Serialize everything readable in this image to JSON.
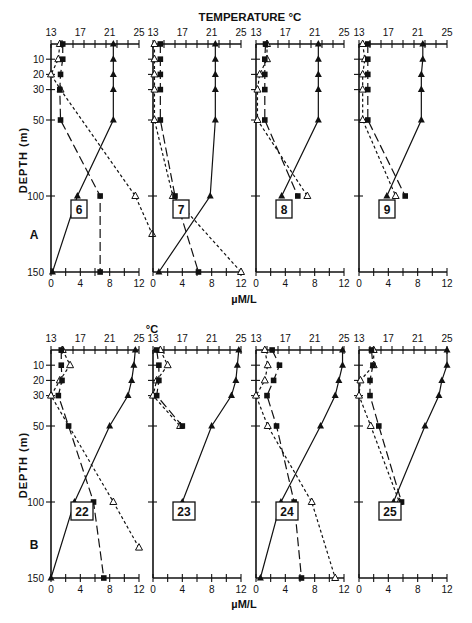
{
  "chart_data": {
    "type": "line",
    "title": "TEMPERATURE °C",
    "top_axis_label_row_A": "TEMPERATURE °C",
    "top_axis_label_row_B": "°C",
    "xlabel": "µM/L",
    "ylabel": "DEPTH (m)",
    "temperature_ticks": [
      "13",
      "17",
      "21",
      "25"
    ],
    "temperature_range": [
      13,
      25
    ],
    "concentration_ticks": [
      "0",
      "4",
      "8",
      "12"
    ],
    "concentration_range": [
      0,
      12
    ],
    "depth_ticks": [
      "10",
      "20",
      "30",
      "50",
      "100",
      "150"
    ],
    "depth_range": [
      0,
      150
    ],
    "series_styles": [
      {
        "name": "Temperature",
        "marker": "filled-triangle",
        "line": "solid",
        "axis": "top (°C)"
      },
      {
        "name": "Nutrient (filled squares)",
        "marker": "filled-square",
        "line": "long-dash",
        "axis": "bottom (µM/L)"
      },
      {
        "name": "Nutrient (open triangles)",
        "marker": "open-triangle",
        "line": "short-dash",
        "axis": "bottom (µM/L)"
      }
    ],
    "rows": [
      {
        "label": "A",
        "panels": [
          {
            "station": "6",
            "temperature": {
              "depth": [
                0,
                10,
                20,
                30,
                50,
                100,
                150
              ],
              "values": [
                21.5,
                21.5,
                21.5,
                21.5,
                21.5,
                16.6,
                13.2
              ]
            },
            "square": {
              "depth": [
                0,
                10,
                20,
                30,
                50,
                100,
                150
              ],
              "values": [
                1.6,
                1.6,
                1.3,
                1.2,
                1.3,
                6.7,
                6.7
              ]
            },
            "triangle": {
              "depth": [
                0,
                10,
                20,
                30,
                100,
                125,
                150
              ],
              "values": [
                1.2,
                1.0,
                0.0,
                1.3,
                11.5,
                13.8,
                null
              ]
            }
          },
          {
            "station": "7",
            "temperature": {
              "depth": [
                0,
                10,
                20,
                30,
                50,
                100,
                150
              ],
              "values": [
                21.5,
                21.5,
                21.5,
                21.5,
                21.5,
                20.8,
                13.8
              ]
            },
            "square": {
              "depth": [
                0,
                10,
                20,
                30,
                50,
                100,
                150
              ],
              "values": [
                1.0,
                1.0,
                1.0,
                1.0,
                1.0,
                3.0,
                6.2
              ]
            },
            "triangle": {
              "depth": [
                0,
                10,
                20,
                30,
                50,
                100,
                150
              ],
              "values": [
                0.2,
                0.2,
                0.2,
                0.2,
                0.2,
                2.7,
                12.0
              ]
            }
          },
          {
            "station": "8",
            "temperature": {
              "depth": [
                0,
                10,
                20,
                30,
                50,
                100
              ],
              "values": [
                21.5,
                21.5,
                21.5,
                21.5,
                21.5,
                16.5
              ]
            },
            "square": {
              "depth": [
                0,
                10,
                20,
                30,
                50,
                100
              ],
              "values": [
                1.3,
                1.2,
                1.2,
                1.2,
                1.2,
                5.7
              ]
            },
            "triangle": {
              "depth": [
                0,
                10,
                20,
                30,
                50,
                100
              ],
              "values": [
                1.5,
                1.5,
                0.5,
                0.2,
                0.2,
                7.0
              ]
            }
          },
          {
            "station": "9",
            "temperature": {
              "depth": [
                0,
                10,
                20,
                30,
                50,
                100
              ],
              "values": [
                21.7,
                21.7,
                21.5,
                21.5,
                21.5,
                16.8
              ]
            },
            "square": {
              "depth": [
                0,
                10,
                20,
                30,
                50,
                100
              ],
              "values": [
                1.2,
                1.2,
                1.2,
                1.2,
                1.2,
                6.3
              ]
            },
            "triangle": {
              "depth": [
                0,
                10,
                20,
                30,
                50,
                100
              ],
              "values": [
                0.5,
                0.8,
                0.5,
                0.5,
                0.5,
                5.0
              ]
            }
          }
        ]
      },
      {
        "label": "B",
        "panels": [
          {
            "station": "22",
            "temperature": {
              "depth": [
                0,
                10,
                20,
                30,
                50,
                100,
                150
              ],
              "values": [
                24.5,
                24.3,
                24.0,
                23.5,
                21.0,
                16.2,
                13.0
              ]
            },
            "square": {
              "depth": [
                0,
                10,
                20,
                30,
                50,
                100,
                150
              ],
              "values": [
                1.4,
                1.4,
                1.5,
                1.0,
                2.4,
                5.8,
                7.2
              ]
            },
            "triangle": {
              "depth": [
                0,
                10,
                20,
                30,
                100,
                130
              ],
              "values": [
                1.6,
                2.6,
                1.2,
                0.0,
                8.5,
                12.0
              ]
            }
          },
          {
            "station": "23",
            "temperature": {
              "depth": [
                0,
                10,
                20,
                30,
                50,
                100
              ],
              "values": [
                24.7,
                24.5,
                24.3,
                23.7,
                21.0,
                17.0
              ]
            },
            "square": {
              "depth": [
                0,
                10,
                20,
                30,
                50
              ],
              "values": [
                0.5,
                0.8,
                0.8,
                0.5,
                4.0
              ]
            },
            "triangle": {
              "depth": [
                0,
                10,
                20,
                30,
                50
              ],
              "values": [
                1.0,
                2.0,
                0.5,
                0.0,
                3.7
              ]
            }
          },
          {
            "station": "24",
            "temperature": {
              "depth": [
                0,
                10,
                20,
                30,
                50,
                100,
                150
              ],
              "values": [
                24.8,
                24.8,
                24.3,
                23.8,
                21.8,
                16.4,
                13.6
              ]
            },
            "square": {
              "depth": [
                0,
                10,
                20,
                30,
                50,
                100,
                150
              ],
              "values": [
                2.2,
                3.2,
                2.4,
                1.5,
                2.8,
                5.2,
                6.2
              ]
            },
            "triangle": {
              "depth": [
                0,
                10,
                20,
                30,
                50,
                100,
                150
              ],
              "values": [
                1.2,
                1.6,
                1.2,
                0.0,
                1.6,
                7.6,
                10.8
              ]
            }
          },
          {
            "station": "25",
            "temperature": {
              "depth": [
                0,
                10,
                20,
                30,
                50,
                100
              ],
              "values": [
                25.0,
                25.0,
                24.3,
                23.9,
                22.0,
                17.7
              ]
            },
            "square": {
              "depth": [
                0,
                10,
                20,
                30,
                50,
                100
              ],
              "values": [
                1.7,
                1.9,
                1.5,
                1.5,
                2.7,
                5.8
              ]
            },
            "triangle": {
              "depth": [
                0,
                10,
                20,
                30,
                50,
                100
              ],
              "values": [
                2.0,
                2.0,
                0.2,
                0.0,
                1.6,
                5.5
              ]
            }
          }
        ]
      }
    ]
  }
}
